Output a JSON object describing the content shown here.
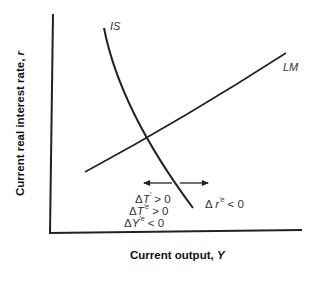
{
  "diagram": {
    "curves": {
      "is": {
        "label": "IS"
      },
      "lm": {
        "label": "LM"
      }
    },
    "axes": {
      "x_title_prefix": "Current output, ",
      "x_title_var": "Y",
      "y_title_prefix": "Current real interest rate, ",
      "y_title_var": "r"
    },
    "annotations": {
      "left": [
        {
          "delta": "Δ",
          "var": "T",
          "sup": "′",
          "rest": " > 0"
        },
        {
          "delta": "Δ",
          "var": "T",
          "sup": "′e",
          "rest": " > 0"
        },
        {
          "delta": "Δ",
          "var": "Y",
          "sup": "′e",
          "rest": " < 0"
        }
      ],
      "right": {
        "delta": "Δ ",
        "var": "r",
        "sup": "′e",
        "rest": " < 0"
      }
    },
    "colors": {
      "line": "#222222",
      "text": "#333333",
      "background": "#ffffff"
    }
  }
}
